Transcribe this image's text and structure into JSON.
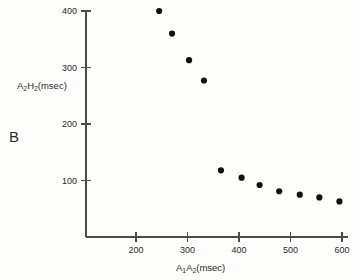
{
  "panel": {
    "label": "B"
  },
  "chart_data": {
    "type": "scatter",
    "title": "",
    "xlabel": "A1A2(msec)",
    "ylabel": "A2H2(msec)",
    "xlabel_parts": {
      "pre": "A",
      "sub1": "1",
      "mid": "A",
      "sub2": "2",
      "post": "(msec)"
    },
    "ylabel_parts": {
      "pre": "A",
      "sub1": "2",
      "mid": "H",
      "sub2": "2",
      "post": "(msec)"
    },
    "xlim": [
      130,
      620
    ],
    "ylim": [
      0,
      430
    ],
    "xticks": [
      200,
      300,
      400,
      500,
      600
    ],
    "yticks": [
      100,
      200,
      300,
      400
    ],
    "xtick_labels": [
      "200",
      "300",
      "400",
      "500",
      "600"
    ],
    "ytick_labels": [
      "100",
      "200",
      "300",
      "400"
    ],
    "grid": false,
    "legend": "none",
    "marker": "filled-circle",
    "marker_color": "#111111",
    "axis_color": "#4a4a4a",
    "x": [
      245,
      270,
      303,
      332,
      365,
      405,
      440,
      478,
      518,
      556,
      595
    ],
    "y": [
      400,
      360,
      313,
      277,
      118,
      105,
      92,
      81,
      75,
      70,
      63
    ],
    "points": [
      {
        "x": 245,
        "y": 400
      },
      {
        "x": 270,
        "y": 360
      },
      {
        "x": 303,
        "y": 313
      },
      {
        "x": 332,
        "y": 277
      },
      {
        "x": 365,
        "y": 118
      },
      {
        "x": 405,
        "y": 105
      },
      {
        "x": 440,
        "y": 92
      },
      {
        "x": 478,
        "y": 81
      },
      {
        "x": 518,
        "y": 75
      },
      {
        "x": 556,
        "y": 70
      },
      {
        "x": 595,
        "y": 63
      }
    ]
  }
}
